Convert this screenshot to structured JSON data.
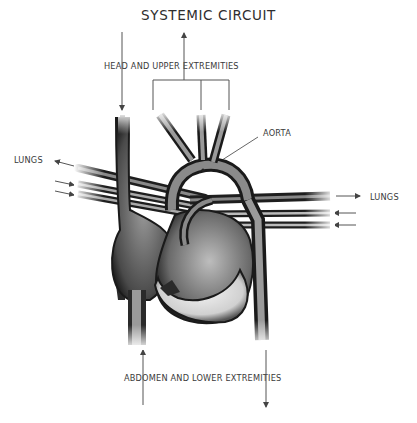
{
  "diagram": {
    "title": "SYSTEMIC CIRCUIT",
    "labels": {
      "head": "HEAD AND UPPER EXTREMITIES",
      "aorta": "AORTA",
      "lungs_left": "LUNGS",
      "lungs_right": "LUNGS",
      "abdomen": "ABDOMEN AND LOWER EXTREMITIES"
    },
    "colors": {
      "vessel_dark": "#1e1e1e",
      "vessel_mid": "#6e6e6e",
      "vessel_light": "#d8d8d8",
      "arrow": "#444444",
      "text": "#3a3a3a"
    }
  }
}
